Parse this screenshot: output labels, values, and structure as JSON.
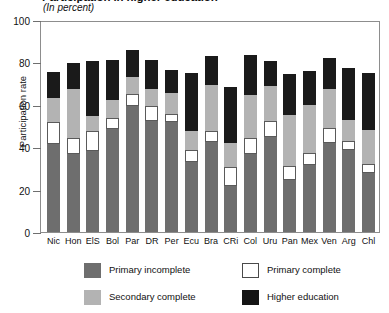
{
  "chart_data": {
    "type": "bar",
    "stacked": true,
    "title": "Participation in higher education",
    "subtitle": "(In percent)",
    "xlabel": "",
    "ylabel": "Participation rate",
    "ylim": [
      0,
      100
    ],
    "yticks": [
      0,
      20,
      40,
      60,
      80,
      100
    ],
    "grid": false,
    "legend_position": "bottom",
    "categories": [
      "Nic",
      "Hon",
      "ElS",
      "Bol",
      "Par",
      "DR",
      "Per",
      "Ecu",
      "Bra",
      "CRi",
      "Col",
      "Uru",
      "Pan",
      "Mex",
      "Ven",
      "Arg",
      "Chl"
    ],
    "series": [
      {
        "name": "Primary incomplete",
        "color": "#6e6e6e",
        "values": [
          41.5,
          37.0,
          38.0,
          48.5,
          59.5,
          52.5,
          52.0,
          33.0,
          42.5,
          21.5,
          37.0,
          45.0,
          24.5,
          31.5,
          42.0,
          38.5,
          28.0
        ]
      },
      {
        "name": "Primary complete",
        "color": "#ffffff",
        "values": [
          10.5,
          7.5,
          9.5,
          5.5,
          5.5,
          7.0,
          3.5,
          5.5,
          5.0,
          9.0,
          7.5,
          7.5,
          6.5,
          6.0,
          7.0,
          4.5,
          4.0
        ]
      },
      {
        "name": "Secondary complete",
        "color": "#b3b3b3",
        "values": [
          11.0,
          23.0,
          7.0,
          8.5,
          8.0,
          8.0,
          10.0,
          9.0,
          22.0,
          11.5,
          20.0,
          16.5,
          24.0,
          22.5,
          18.5,
          10.0,
          16.0
        ]
      },
      {
        "name": "Higher education",
        "color": "#1a1a1a",
        "values": [
          12.5,
          12.0,
          26.0,
          18.5,
          13.0,
          13.5,
          11.0,
          27.5,
          13.5,
          26.5,
          19.0,
          11.5,
          19.5,
          16.0,
          14.5,
          24.5,
          27.0
        ]
      }
    ],
    "totals": [
      75.5,
      79.5,
      80.5,
      81.0,
      86.0,
      81.0,
      76.5,
      75.0,
      83.0,
      68.5,
      83.5,
      80.5,
      74.5,
      76.0,
      82.0,
      77.5,
      75.0
    ]
  },
  "legend": {
    "items": [
      {
        "label": "Primary incomplete",
        "swatch": "pi"
      },
      {
        "label": "Primary complete",
        "swatch": "pc"
      },
      {
        "label": "Secondary complete",
        "swatch": "sc"
      },
      {
        "label": "Higher education",
        "swatch": "he"
      }
    ]
  }
}
